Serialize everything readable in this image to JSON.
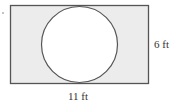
{
  "diagram": {
    "shape": "rectangle with inscribed circle",
    "rectangle": {
      "fill": "#ececec",
      "stroke": "#555555"
    },
    "circle": {
      "fill": "#ffffff",
      "stroke": "#555555"
    },
    "labels": {
      "width": "11 ft",
      "height": "6 ft"
    }
  }
}
